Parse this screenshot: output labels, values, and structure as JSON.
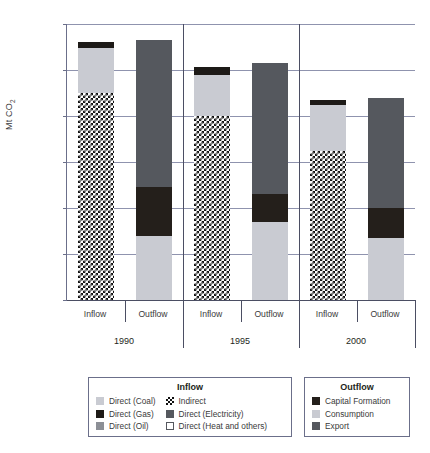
{
  "chart_data": {
    "type": "bar",
    "title": "",
    "xlabel": "",
    "ylabel": "Mt CO2",
    "ylabel_main": "Mt CO",
    "ylabel_sub": "2",
    "ylim": [
      0,
      120000
    ],
    "ytick_labels": [
      "120,000",
      "100,000",
      "80,000",
      "60,000",
      "40,000",
      "20,000",
      "0"
    ],
    "ytick_values": [
      120000,
      100000,
      80000,
      60000,
      40000,
      20000,
      0
    ],
    "grid": true,
    "stacked": true,
    "groups": [
      {
        "year": "1990",
        "bars": [
          {
            "label": "Inflow",
            "total": 112000,
            "segments": [
              {
                "name": "Indirect",
                "value": 90000,
                "style": "sw-indirect"
              },
              {
                "name": "Direct (Coal)",
                "value": 19500,
                "style": "sw-coal"
              },
              {
                "name": "Direct (Gas)",
                "value": 2500,
                "style": "sw-gas"
              }
            ]
          },
          {
            "label": "Outflow",
            "total": 113000,
            "segments": [
              {
                "name": "Consumption",
                "value": 28000,
                "style": "sw-cons"
              },
              {
                "name": "Capital Formation",
                "value": 21000,
                "style": "sw-cap"
              },
              {
                "name": "Export",
                "value": 64000,
                "style": "sw-exp"
              }
            ]
          }
        ]
      },
      {
        "year": "1995",
        "bars": [
          {
            "label": "Inflow",
            "total": 101500,
            "segments": [
              {
                "name": "Indirect",
                "value": 80000,
                "style": "sw-indirect"
              },
              {
                "name": "Direct (Coal)",
                "value": 18000,
                "style": "sw-coal"
              },
              {
                "name": "Direct (Gas)",
                "value": 3500,
                "style": "sw-gas"
              }
            ]
          },
          {
            "label": "Outflow",
            "total": 103000,
            "segments": [
              {
                "name": "Consumption",
                "value": 34000,
                "style": "sw-cons"
              },
              {
                "name": "Capital Formation",
                "value": 12000,
                "style": "sw-cap"
              },
              {
                "name": "Export",
                "value": 57000,
                "style": "sw-exp"
              }
            ]
          }
        ]
      },
      {
        "year": "2000",
        "bars": [
          {
            "label": "Inflow",
            "total": 87000,
            "segments": [
              {
                "name": "Indirect",
                "value": 65000,
                "style": "sw-indirect"
              },
              {
                "name": "Direct (Coal)",
                "value": 20000,
                "style": "sw-coal"
              },
              {
                "name": "Direct (Gas)",
                "value": 2000,
                "style": "sw-gas"
              }
            ]
          },
          {
            "label": "Outflow",
            "total": 88000,
            "segments": [
              {
                "name": "Consumption",
                "value": 27000,
                "style": "sw-cons"
              },
              {
                "name": "Capital Formation",
                "value": 13000,
                "style": "sw-cap"
              },
              {
                "name": "Export",
                "value": 48000,
                "style": "sw-exp"
              }
            ]
          }
        ]
      }
    ],
    "legends": [
      {
        "title": "Inflow",
        "columns": [
          [
            {
              "label": "Direct (Coal)",
              "style": "sw-coal"
            },
            {
              "label": "Direct (Gas)",
              "style": "sw-gas"
            },
            {
              "label": "Direct (Oil)",
              "style": "sw-oil"
            }
          ],
          [
            {
              "label": "Indirect",
              "style": "sw-indirect"
            },
            {
              "label": "Direct (Electricity)",
              "style": "sw-elec"
            },
            {
              "label": "Direct (Heat and others)",
              "style": "sw-heat"
            }
          ]
        ]
      },
      {
        "title": "Outflow",
        "columns": [
          [
            {
              "label": "Capital Formation",
              "style": "sw-cap"
            },
            {
              "label": "Consumption",
              "style": "sw-cons"
            },
            {
              "label": "Export",
              "style": "sw-exp"
            }
          ]
        ]
      }
    ],
    "colors": {
      "coal": "#c9cbd2",
      "gas": "#1d1a17",
      "oil": "#8c8f96",
      "electricity": "#55585e",
      "heat": "#ffffff",
      "capital_formation": "#241f1b",
      "consumption": "#c9cbd2",
      "export": "#55585e",
      "gridline": "#8f93ae",
      "axis": "#4b4e63"
    }
  }
}
